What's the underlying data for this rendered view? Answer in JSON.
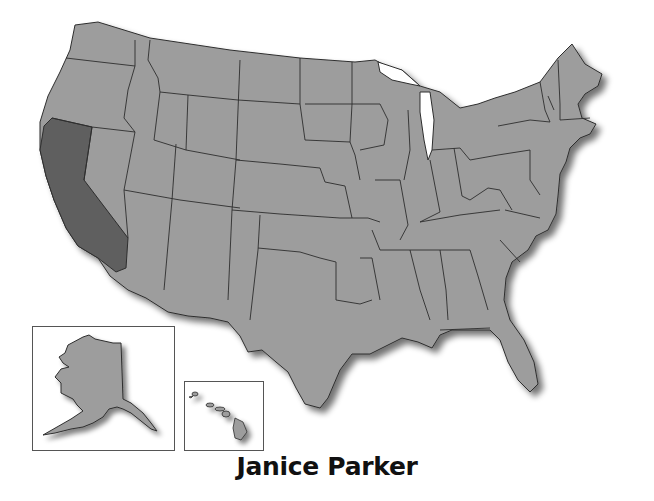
{
  "map": {
    "title": "United States",
    "highlighted_state": "California",
    "colors": {
      "land": "#9d9d9d",
      "highlight": "#5e5e5e",
      "border": "#2e2e2e",
      "shadow": "#6a6a6a",
      "background": "#ffffff"
    },
    "insets": [
      {
        "name": "Alaska"
      },
      {
        "name": "Hawaii"
      }
    ]
  },
  "caption": {
    "author": "Janice Parker"
  }
}
